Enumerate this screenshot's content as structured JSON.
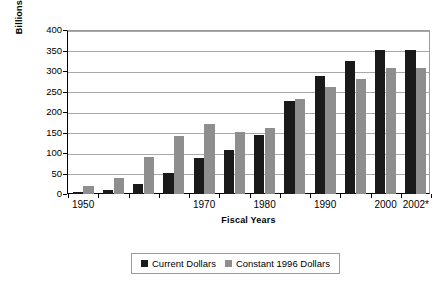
{
  "chart_data": {
    "type": "bar",
    "title": "",
    "xlabel": "Fiscal Years",
    "ylabel": "Billions of Dollars",
    "ylim": [
      0,
      400
    ],
    "ytick_labels": [
      "400",
      "350",
      "300",
      "250",
      "200",
      "150",
      "100",
      "50",
      "0"
    ],
    "ytick_values": [
      400,
      350,
      300,
      250,
      200,
      150,
      100,
      50,
      0
    ],
    "grid": true,
    "legend_position": "bottom",
    "categories": [
      "1950",
      "1955",
      "1960",
      "1965",
      "1970",
      "1975",
      "1980",
      "1985",
      "1990",
      "1995",
      "2000",
      "2002*"
    ],
    "xtick_labels": [
      "1950",
      "1970",
      "1980",
      "1990",
      "2000",
      "2002*"
    ],
    "xtick_label_indices": [
      0,
      4,
      6,
      8,
      10,
      11
    ],
    "series": [
      {
        "name": "Current Dollars",
        "color": "#1a1a1a",
        "values": [
          6,
          10,
          25,
          52,
          88,
          107,
          143,
          228,
          289,
          324,
          352,
          352
        ]
      },
      {
        "name": "Constant 1996 Dollars",
        "color": "#8e8e8e",
        "values": [
          19,
          39,
          90,
          141,
          171,
          151,
          161,
          231,
          261,
          281,
          307,
          307
        ]
      }
    ],
    "groups": [
      {
        "label": "1950",
        "current": 6,
        "constant": 19
      },
      {
        "label": "1955",
        "current": 10,
        "constant": 39
      },
      {
        "label": "1960",
        "current": 25,
        "constant": 90
      },
      {
        "label": "1965",
        "current": 52,
        "constant": 141
      },
      {
        "label": "1970",
        "current": 88,
        "constant": 171
      },
      {
        "label": "1975",
        "current": 107,
        "constant": 151
      },
      {
        "label": "1980",
        "current": 143,
        "constant": 161
      },
      {
        "label": "1985",
        "current": 228,
        "constant": 231
      },
      {
        "label": "1990",
        "current": 289,
        "constant": 261
      },
      {
        "label": "1995",
        "current": 324,
        "constant": 281
      },
      {
        "label": "2000",
        "current": 352,
        "constant": 307
      },
      {
        "label": "2002*",
        "current": 352,
        "constant": 307
      }
    ]
  },
  "axes": {
    "y_title": "Billions of Dollars",
    "x_title": "Fiscal Years"
  },
  "legend": {
    "items": [
      {
        "label": "Current Dollars",
        "color": "#1a1a1a"
      },
      {
        "label": "Constant 1996 Dollars",
        "color": "#8e8e8e"
      }
    ]
  }
}
